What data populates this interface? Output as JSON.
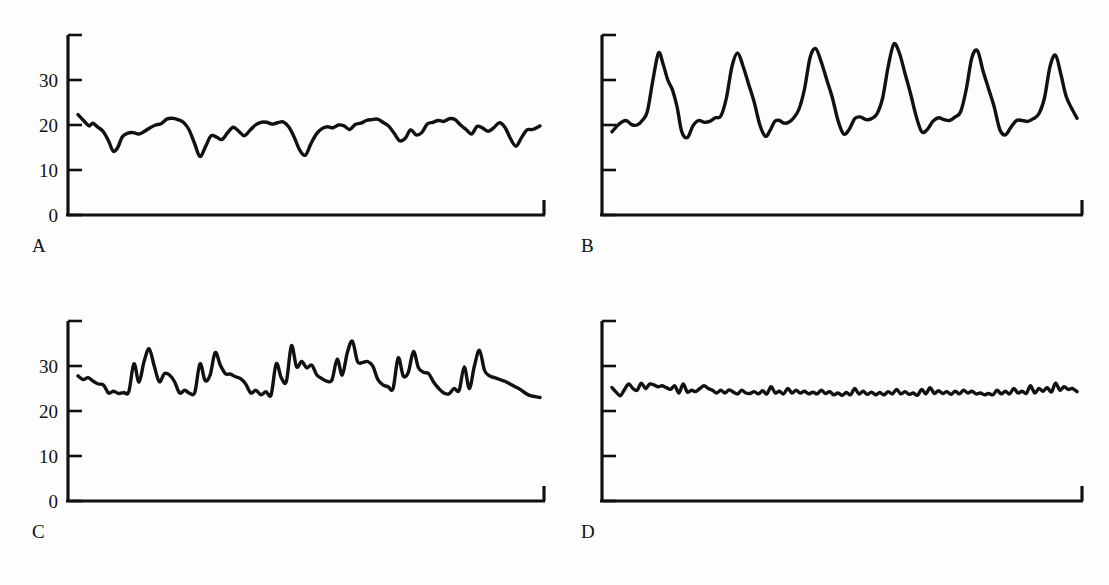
{
  "figure": {
    "background_color": "#fdfdfd",
    "line_color": "#111111",
    "panel_count": 4,
    "layout": "2x2 grid"
  },
  "panels": [
    {
      "letter": "A",
      "show_y_labels": true
    },
    {
      "letter": "B",
      "show_y_labels": false
    },
    {
      "letter": "C",
      "show_y_labels": true
    },
    {
      "letter": "D",
      "show_y_labels": false
    }
  ],
  "axis": {
    "y_tick_values": [
      0,
      10,
      20,
      30,
      40
    ],
    "y_tick_labels": [
      "0",
      "10",
      "20",
      "30",
      ""
    ],
    "y_min": 0,
    "y_max": 40,
    "x_min": 0,
    "x_max": 100
  },
  "chart_data": [
    {
      "type": "line",
      "title": "A",
      "xlabel": "",
      "ylabel": "",
      "ylim": [
        0,
        40
      ],
      "xlim": [
        0,
        100
      ],
      "grid": false,
      "legend": "none",
      "series": [
        {
          "name": "A",
          "x": [
            0,
            1.2,
            2.4,
            3.2,
            4.2,
            5.4,
            6.6,
            7.6,
            8.6,
            9.6,
            10.8,
            12,
            13.2,
            14.4,
            15.6,
            16.8,
            18,
            19.2,
            20.4,
            21.6,
            22.8,
            24,
            25.2,
            26.4,
            27.6,
            28.8,
            30,
            31.2,
            32.4,
            33.6,
            34.8,
            36,
            37.2,
            38.4,
            39.6,
            40.8,
            42,
            43.2,
            44.4,
            45.6,
            46.8,
            48,
            49.2,
            50.4,
            51.6,
            52.8,
            54,
            55.2,
            56.4,
            57.6,
            58.8,
            60,
            61.2,
            62.4,
            63.6,
            64.8,
            66,
            67.2,
            68.4,
            69.6,
            70.8,
            72,
            73.2,
            74.4,
            75.6,
            76.8,
            78,
            79.2,
            80.4,
            81.6,
            82.8,
            84,
            85.2,
            86.4,
            87.6,
            88.8,
            90,
            91.2,
            92.4,
            93.6,
            94.8,
            96,
            97.2,
            98.4,
            100
          ],
          "y": [
            22.3,
            21.0,
            19.8,
            20.4,
            19.6,
            18.6,
            16.5,
            14.2,
            15.0,
            17.4,
            18.2,
            18.3,
            18.0,
            18.6,
            19.4,
            20.0,
            20.3,
            21.3,
            21.5,
            21.2,
            20.6,
            19.0,
            16.0,
            13.0,
            15.2,
            17.6,
            17.3,
            16.8,
            18.3,
            19.5,
            18.6,
            17.6,
            18.8,
            20.0,
            20.6,
            20.6,
            20.2,
            20.5,
            20.7,
            19.6,
            17.3,
            14.4,
            13.3,
            15.8,
            18.0,
            19.2,
            19.6,
            19.4,
            20.0,
            19.8,
            19.0,
            20.1,
            20.4,
            21.0,
            21.2,
            21.3,
            20.6,
            19.8,
            18.2,
            16.5,
            17.0,
            18.9,
            17.8,
            18.3,
            20.2,
            20.6,
            21.0,
            20.8,
            21.4,
            21.2,
            20.0,
            19.0,
            18.0,
            19.7,
            19.3,
            18.6,
            19.4,
            20.5,
            19.5,
            17.0,
            15.3,
            17.2,
            18.9,
            19.0,
            19.8
          ]
        }
      ]
    },
    {
      "type": "line",
      "title": "B",
      "xlabel": "",
      "ylabel": "",
      "ylim": [
        0,
        40
      ],
      "xlim": [
        0,
        100
      ],
      "grid": false,
      "legend": "none",
      "series": [
        {
          "name": "B",
          "x": [
            0,
            1.5,
            3,
            4.2,
            5.4,
            6.5,
            7.6,
            8.8,
            10,
            11,
            12,
            13,
            14,
            15,
            16.2,
            17.4,
            18.6,
            19.8,
            21,
            22.2,
            23.4,
            24.6,
            25.8,
            27,
            28.2,
            29.4,
            30.6,
            31.8,
            33,
            34,
            35,
            36,
            37,
            38,
            39,
            40.2,
            41.4,
            42.6,
            43.8,
            45,
            46.2,
            47.4,
            48.6,
            49.8,
            51,
            52.2,
            53.4,
            54.6,
            55.8,
            57,
            58.2,
            59.4,
            60.6,
            61.8,
            63,
            64.2,
            65.4,
            66.6,
            67.8,
            69,
            70.2,
            71.4,
            72.6,
            73.8,
            75,
            76.2,
            77.4,
            78.6,
            79.8,
            81,
            82.2,
            83.4,
            84.6,
            85.8,
            87,
            88.2,
            89.4,
            90.6,
            91.8,
            93,
            94.2,
            95.4,
            96.6,
            97.8,
            100
          ],
          "y": [
            18.5,
            20.2,
            21.0,
            20.1,
            20.0,
            21.0,
            23.0,
            30.0,
            36.0,
            33.5,
            30.0,
            27.8,
            24.0,
            18.5,
            17.2,
            19.8,
            21.0,
            20.6,
            20.8,
            21.6,
            22.0,
            26.0,
            33.0,
            36.0,
            33.0,
            29.0,
            25.0,
            20.0,
            17.5,
            18.8,
            20.8,
            21.0,
            20.4,
            20.6,
            21.5,
            23.5,
            28.0,
            35.0,
            37.0,
            34.0,
            30.0,
            26.0,
            21.0,
            18.0,
            19.0,
            21.4,
            21.8,
            21.2,
            21.4,
            22.5,
            26.0,
            33.0,
            38.0,
            36.0,
            31.5,
            27.0,
            22.0,
            18.5,
            19.0,
            20.8,
            21.6,
            21.2,
            21.0,
            21.8,
            23.0,
            28.0,
            35.0,
            36.5,
            32.0,
            28.0,
            24.0,
            19.0,
            17.8,
            19.5,
            21.0,
            21.0,
            20.8,
            21.4,
            22.5,
            26.0,
            33.0,
            35.5,
            31.0,
            26.0,
            21.5
          ]
        }
      ]
    },
    {
      "type": "line",
      "title": "C",
      "xlabel": "",
      "ylabel": "",
      "ylim": [
        0,
        40
      ],
      "xlim": [
        0,
        100
      ],
      "grid": false,
      "legend": "none",
      "series": [
        {
          "name": "C",
          "x": [
            0,
            1.1,
            2.2,
            3.3,
            4.4,
            5.5,
            6.6,
            7.7,
            8.8,
            9.9,
            11,
            12.1,
            13.2,
            14.3,
            15.4,
            16.5,
            17.6,
            18.7,
            19.8,
            20.9,
            22,
            23.1,
            24.2,
            25.3,
            26.4,
            27.5,
            28.6,
            29.7,
            30.8,
            31.9,
            33,
            34.1,
            35.2,
            36.3,
            37.4,
            38.5,
            39.6,
            40.7,
            41.8,
            42.9,
            44,
            45.1,
            46.2,
            47.3,
            48.4,
            49.5,
            50.6,
            51.7,
            52.8,
            53.9,
            55,
            56.1,
            57.2,
            58.3,
            59.4,
            60.5,
            61.6,
            62.7,
            63.8,
            64.9,
            66,
            67.1,
            68.2,
            69.3,
            70.4,
            71.5,
            72.6,
            73.7,
            74.8,
            75.9,
            77,
            78.1,
            79.2,
            80.3,
            81.4,
            82.5,
            83.6,
            84.7,
            85.8,
            86.9,
            88,
            89.1,
            90.2,
            91.3,
            92.4,
            93.5,
            94.6,
            95.7,
            96.8,
            97.9,
            100
          ],
          "y": [
            27.8,
            27.0,
            27.4,
            26.6,
            26.0,
            25.8,
            24.0,
            24.4,
            23.9,
            24.1,
            24.3,
            30.5,
            26.4,
            31.0,
            33.8,
            30.0,
            26.5,
            28.3,
            28.0,
            26.5,
            24.0,
            24.6,
            23.9,
            24.2,
            30.5,
            26.8,
            28.0,
            33.0,
            30.2,
            28.3,
            28.2,
            27.6,
            27.2,
            26.0,
            24.0,
            24.6,
            23.6,
            24.3,
            23.6,
            30.5,
            27.4,
            26.6,
            34.5,
            29.8,
            31.0,
            29.6,
            30.2,
            28.0,
            27.2,
            26.6,
            27.0,
            31.5,
            28.0,
            33.0,
            35.5,
            31.0,
            30.8,
            31.0,
            30.0,
            27.0,
            25.8,
            25.4,
            25.0,
            31.8,
            27.8,
            28.6,
            33.2,
            29.6,
            28.6,
            28.3,
            26.4,
            25.0,
            24.0,
            23.8,
            25.0,
            24.6,
            29.8,
            25.0,
            30.0,
            33.5,
            29.0,
            27.8,
            27.4,
            27.0,
            26.6,
            26.0,
            25.4,
            24.8,
            24.0,
            23.4,
            23.0
          ]
        }
      ]
    },
    {
      "type": "line",
      "title": "D",
      "xlabel": "",
      "ylabel": "",
      "ylim": [
        0,
        40
      ],
      "xlim": [
        0,
        100
      ],
      "grid": false,
      "legend": "none",
      "series": [
        {
          "name": "D",
          "x": [
            0,
            0.9,
            1.8,
            2.7,
            3.6,
            4.5,
            5.4,
            6.3,
            7.2,
            8.1,
            9,
            9.9,
            10.8,
            11.7,
            12.6,
            13.5,
            14.4,
            15.3,
            16.2,
            17.1,
            18,
            18.9,
            19.8,
            20.7,
            21.6,
            22.5,
            23.4,
            24.3,
            25.2,
            26.1,
            27,
            27.9,
            28.8,
            29.7,
            30.6,
            31.5,
            32.4,
            33.3,
            34.2,
            35.1,
            36,
            36.9,
            37.8,
            38.7,
            39.6,
            40.5,
            41.4,
            42.3,
            43.2,
            44.1,
            45,
            45.9,
            46.8,
            47.7,
            48.6,
            49.5,
            50.4,
            51.3,
            52.2,
            53.1,
            54,
            54.9,
            55.8,
            56.7,
            57.6,
            58.5,
            59.4,
            60.3,
            61.2,
            62.1,
            63,
            63.9,
            64.8,
            65.7,
            66.6,
            67.5,
            68.4,
            69.3,
            70.2,
            71.1,
            72,
            72.9,
            73.8,
            74.7,
            75.6,
            76.5,
            77.4,
            78.3,
            79.2,
            80.1,
            81,
            81.9,
            82.8,
            83.7,
            84.6,
            85.5,
            86.4,
            87.3,
            88.2,
            89.1,
            90,
            90.9,
            91.8,
            92.7,
            93.6,
            94.5,
            95.4,
            96.3,
            97.2,
            98.1,
            99,
            100
          ],
          "y": [
            25.2,
            24.2,
            23.4,
            24.8,
            26.0,
            25.0,
            24.6,
            26.2,
            25.0,
            26.0,
            25.8,
            25.4,
            25.6,
            25.2,
            24.8,
            25.6,
            24.0,
            26.0,
            24.2,
            24.6,
            24.3,
            25.0,
            25.6,
            25.0,
            24.6,
            24.0,
            24.6,
            24.0,
            24.7,
            24.2,
            23.8,
            24.6,
            24.0,
            23.9,
            24.3,
            23.8,
            24.5,
            23.8,
            25.4,
            24.0,
            24.4,
            23.8,
            25.0,
            24.0,
            24.6,
            24.0,
            24.4,
            23.8,
            24.2,
            23.8,
            24.6,
            23.9,
            24.3,
            23.6,
            24.0,
            23.5,
            24.1,
            23.6,
            25.0,
            23.8,
            24.4,
            23.7,
            24.2,
            23.6,
            24.1,
            23.6,
            24.3,
            23.8,
            24.8,
            23.8,
            24.3,
            23.7,
            24.0,
            23.5,
            24.8,
            23.8,
            25.2,
            23.9,
            24.5,
            23.9,
            24.3,
            23.7,
            24.4,
            23.8,
            24.6,
            24.0,
            24.4,
            23.8,
            24.0,
            23.6,
            23.9,
            23.6,
            24.6,
            23.8,
            24.4,
            23.8,
            25.0,
            24.0,
            24.4,
            23.9,
            25.6,
            24.0,
            25.0,
            24.4,
            25.2,
            24.2,
            26.2,
            24.6,
            25.4,
            24.8,
            25.0,
            24.3,
            26.0
          ]
        }
      ]
    }
  ]
}
